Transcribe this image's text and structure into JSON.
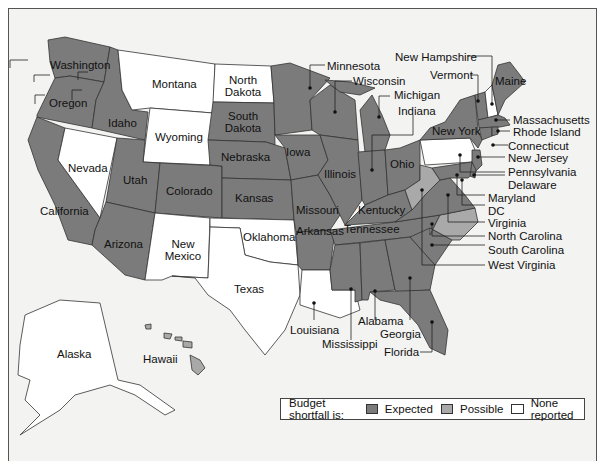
{
  "legend": {
    "title": "Budget shortfall is:",
    "items": [
      {
        "label": "Expected",
        "color": "#7b7b7b"
      },
      {
        "label": "Possible",
        "color": "#a9a9a9"
      },
      {
        "label": "None reported",
        "color": "#ffffff"
      }
    ]
  },
  "colors": {
    "expected": "#7b7b7b",
    "possible": "#a9a9a9",
    "none": "#ffffff",
    "background": "#f3f3f1",
    "border": "#333333"
  },
  "states": {
    "washington": {
      "label": "Washington",
      "status": "Expected"
    },
    "oregon": {
      "label": "Oregon",
      "status": "Expected"
    },
    "california": {
      "label": "California",
      "status": "Expected"
    },
    "idaho": {
      "label": "Idaho",
      "status": "Expected"
    },
    "nevada": {
      "label": "Nevada",
      "status": "None reported"
    },
    "montana": {
      "label": "Montana",
      "status": "None reported"
    },
    "wyoming": {
      "label": "Wyoming",
      "status": "None reported"
    },
    "utah": {
      "label": "Utah",
      "status": "Expected"
    },
    "arizona": {
      "label": "Arizona",
      "status": "Expected"
    },
    "colorado": {
      "label": "Colorado",
      "status": "Expected"
    },
    "new_mexico": {
      "label": "New\nMexico",
      "status": "None reported"
    },
    "north_dakota": {
      "label": "North\nDakota",
      "status": "None reported"
    },
    "south_dakota": {
      "label": "South\nDakota",
      "status": "Expected"
    },
    "nebraska": {
      "label": "Nebraska",
      "status": "Expected"
    },
    "kansas": {
      "label": "Kansas",
      "status": "Expected"
    },
    "oklahoma": {
      "label": "Oklahoma",
      "status": "None reported"
    },
    "texas": {
      "label": "Texas",
      "status": "None reported"
    },
    "minnesota": {
      "label": "Minnesota",
      "status": "Expected"
    },
    "iowa": {
      "label": "Iowa",
      "status": "Expected"
    },
    "missouri": {
      "label": "Missouri",
      "status": "Expected"
    },
    "arkansas": {
      "label": "Arkansas",
      "status": "Expected"
    },
    "louisiana": {
      "label": "Louisiana",
      "status": "None reported"
    },
    "wisconsin": {
      "label": "Wisconsin",
      "status": "Expected"
    },
    "illinois": {
      "label": "Illinois",
      "status": "Expected"
    },
    "michigan": {
      "label": "Michigan",
      "status": "Expected"
    },
    "indiana": {
      "label": "Indiana",
      "status": "Expected"
    },
    "ohio": {
      "label": "Ohio",
      "status": "Expected"
    },
    "kentucky": {
      "label": "Kentucky",
      "status": "Expected"
    },
    "tennessee": {
      "label": "Tennessee",
      "status": "Expected"
    },
    "mississippi": {
      "label": "Mississippi",
      "status": "Expected"
    },
    "alabama": {
      "label": "Alabama",
      "status": "Expected"
    },
    "georgia": {
      "label": "Georgia",
      "status": "Expected"
    },
    "florida": {
      "label": "Florida",
      "status": "Expected"
    },
    "south_carolina": {
      "label": "South Carolina",
      "status": "Expected"
    },
    "north_carolina": {
      "label": "North Carolina",
      "status": "Possible"
    },
    "virginia": {
      "label": "Virginia",
      "status": "Expected"
    },
    "west_virginia": {
      "label": "West Virginia",
      "status": "Possible"
    },
    "dc": {
      "label": "DC",
      "status": "Expected"
    },
    "maryland": {
      "label": "Maryland",
      "status": "Expected"
    },
    "delaware": {
      "label": "Delaware",
      "status": "Expected"
    },
    "pennsylvania": {
      "label": "Pennsylvania",
      "status": "None reported"
    },
    "new_jersey": {
      "label": "New Jersey",
      "status": "Expected"
    },
    "new_york": {
      "label": "New York",
      "status": "Expected"
    },
    "connecticut": {
      "label": "Connecticut",
      "status": "Expected"
    },
    "rhode_island": {
      "label": "Rhode Island",
      "status": "Expected"
    },
    "massachusetts": {
      "label": "Massachusetts",
      "status": "Expected"
    },
    "vermont": {
      "label": "Vermont",
      "status": "Expected"
    },
    "new_hampshire": {
      "label": "New Hampshire",
      "status": "None reported"
    },
    "maine": {
      "label": "Maine",
      "status": "Expected"
    },
    "alaska": {
      "label": "Alaska",
      "status": "None reported"
    },
    "hawaii": {
      "label": "Hawaii",
      "status": "Expected"
    }
  }
}
